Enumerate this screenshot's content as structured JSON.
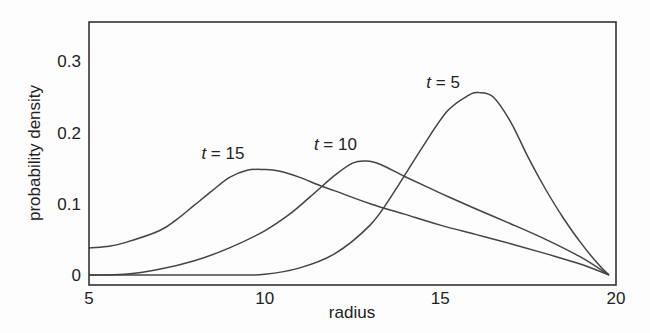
{
  "chart_data": {
    "type": "line",
    "title": "",
    "xlabel": "radius",
    "ylabel": "probability density",
    "xlim": [
      5,
      20
    ],
    "ylim": [
      -0.014,
      0.355
    ],
    "grid": false,
    "legend": "none (inline curve labels)",
    "x_ticks": [
      5,
      10,
      15,
      20
    ],
    "x_tick_labels": [
      "5",
      "10",
      "15",
      "20"
    ],
    "y_ticks": [
      0,
      0.1,
      0.2,
      0.3
    ],
    "y_tick_labels": [
      "0",
      "0.1",
      "0.2",
      "0.3"
    ],
    "series": [
      {
        "name": "t = 5",
        "label_var": "t",
        "label_value": "= 5",
        "label_pos": [
          14.6,
          0.262
        ],
        "x": [
          5,
          9,
          10,
          11,
          12,
          13,
          13.6,
          14.5,
          15.2,
          15.8,
          16.1,
          16.5,
          17,
          17.5,
          18,
          18.5,
          19,
          19.5,
          19.8
        ],
        "y": [
          0,
          0,
          0.001,
          0.01,
          0.03,
          0.07,
          0.11,
          0.18,
          0.23,
          0.252,
          0.256,
          0.25,
          0.215,
          0.165,
          0.12,
          0.08,
          0.045,
          0.015,
          0
        ]
      },
      {
        "name": "t = 10",
        "label_var": "t",
        "label_value": "= 10",
        "label_pos": [
          11.4,
          0.175
        ],
        "x": [
          5,
          6,
          7,
          8,
          9,
          10,
          10.7,
          11.3,
          12,
          12.5,
          12.9,
          13.3,
          14,
          15,
          16,
          17,
          18,
          19,
          19.8
        ],
        "y": [
          0,
          0.001,
          0.008,
          0.02,
          0.038,
          0.062,
          0.085,
          0.11,
          0.14,
          0.157,
          0.16,
          0.155,
          0.138,
          0.115,
          0.093,
          0.072,
          0.05,
          0.025,
          0
        ]
      },
      {
        "name": "t = 15",
        "label_var": "t",
        "label_value": "= 15",
        "label_pos": [
          8.2,
          0.163
        ],
        "x": [
          5,
          5.5,
          6,
          7,
          7.5,
          8,
          8.5,
          9,
          9.5,
          10,
          10.4,
          11,
          11.5,
          12,
          13,
          14,
          15,
          16,
          17,
          18,
          19,
          19.8
        ],
        "y": [
          0.038,
          0.04,
          0.045,
          0.062,
          0.078,
          0.098,
          0.118,
          0.137,
          0.147,
          0.148,
          0.146,
          0.137,
          0.127,
          0.118,
          0.1,
          0.085,
          0.07,
          0.057,
          0.044,
          0.03,
          0.015,
          0
        ]
      }
    ]
  }
}
